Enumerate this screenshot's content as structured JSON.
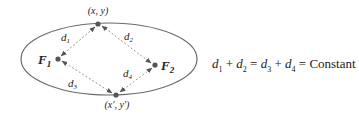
{
  "diagram": {
    "points": {
      "top": {
        "label": "(x, y)"
      },
      "bottom": {
        "label": "(x′, y′)"
      },
      "f1": {
        "label": "F",
        "sub": "1"
      },
      "f2": {
        "label": "F",
        "sub": "2"
      }
    },
    "distances": [
      {
        "label": "d",
        "sub": "1"
      },
      {
        "label": "d",
        "sub": "2"
      },
      {
        "label": "d",
        "sub": "3"
      },
      {
        "label": "d",
        "sub": "4"
      }
    ],
    "colors": {
      "ellipse": "#6b6b6b",
      "dashed": "#9a9a9a",
      "dot": "#555555",
      "text": "#222222"
    }
  },
  "formula": {
    "d": "d",
    "s1": "1",
    "s2": "2",
    "s3": "3",
    "s4": "4",
    "plus": " + ",
    "eq": " = ",
    "constant": "Constant"
  }
}
